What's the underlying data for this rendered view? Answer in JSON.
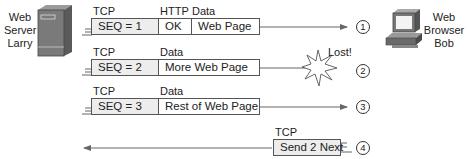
{
  "nodes": {
    "server": {
      "label_lines": [
        "Web",
        "Server",
        "Larry"
      ],
      "icon": "server-tower-icon"
    },
    "client": {
      "label_lines": [
        "Web",
        "Browser",
        "Bob"
      ],
      "icon": "desktop-computer-icon"
    }
  },
  "segments": [
    {
      "step": "1",
      "direction": "server-to-client",
      "header_labels": [
        "TCP",
        "HTTP",
        "Data"
      ],
      "fields": [
        "SEQ = 1",
        "OK",
        "Web Page"
      ],
      "lost": false
    },
    {
      "step": "2",
      "direction": "server-to-client",
      "header_labels": [
        "TCP",
        "Data"
      ],
      "fields": [
        "SEQ = 2",
        "More Web Page"
      ],
      "lost": true,
      "lost_label": "Lost!"
    },
    {
      "step": "3",
      "direction": "server-to-client",
      "header_labels": [
        "TCP",
        "Data"
      ],
      "fields": [
        "SEQ = 3",
        "Rest of Web Page"
      ],
      "lost": false
    },
    {
      "step": "4",
      "direction": "client-to-server",
      "header_labels": [
        "TCP"
      ],
      "fields": [
        "Send 2 Next"
      ],
      "lost": false
    }
  ],
  "colors": {
    "line": "#666666",
    "tcp_fill": "#ededed",
    "border": "#555555"
  }
}
